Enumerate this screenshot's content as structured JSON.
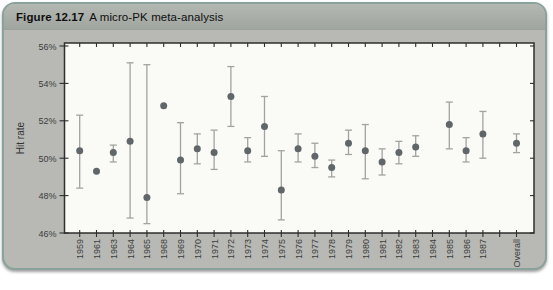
{
  "header": {
    "figure_label": "Figure 12.17",
    "title": "A micro-PK meta-analysis"
  },
  "chart_data": {
    "type": "scatter",
    "title": "Figure 12.17 A micro-PK meta-analysis",
    "ylabel": "Hit rate",
    "xlabel": "",
    "ylim": [
      46,
      56
    ],
    "grid": "off",
    "legend": "none",
    "yticks": [
      {
        "value": 46,
        "label": "46%"
      },
      {
        "value": 48,
        "label": "48%"
      },
      {
        "value": 50,
        "label": "50%"
      },
      {
        "value": 52,
        "label": "52%"
      },
      {
        "value": 54,
        "label": "54%"
      },
      {
        "value": 56,
        "label": "56%"
      }
    ],
    "categories": [
      "1959",
      "1961",
      "1963",
      "1964",
      "1965",
      "1968",
      "1969",
      "1970",
      "1971",
      "1972",
      "1973",
      "1974",
      "1975",
      "1976",
      "1977",
      "1978",
      "1979",
      "1980",
      "1981",
      "1982",
      "1983",
      "1984",
      "1985",
      "1986",
      "1987",
      "",
      "Overall"
    ],
    "points": [
      {
        "x": "1959",
        "y": 50.4,
        "lo": 48.4,
        "hi": 52.3
      },
      {
        "x": "1961",
        "y": 49.3
      },
      {
        "x": "1963",
        "y": 50.3,
        "lo": 49.8,
        "hi": 50.7
      },
      {
        "x": "1964",
        "y": 50.9,
        "lo": 46.8,
        "hi": 55.1
      },
      {
        "x": "1965",
        "y": 47.9,
        "lo": 46.5,
        "hi": 55.0
      },
      {
        "x": "1968",
        "y": 52.8
      },
      {
        "x": "1969",
        "y": 49.9,
        "lo": 48.1,
        "hi": 51.9
      },
      {
        "x": "1970",
        "y": 50.5,
        "lo": 49.7,
        "hi": 51.3
      },
      {
        "x": "1971",
        "y": 50.3,
        "lo": 49.4,
        "hi": 51.5
      },
      {
        "x": "1972",
        "y": 53.3,
        "lo": 51.7,
        "hi": 54.9
      },
      {
        "x": "1973",
        "y": 50.4,
        "lo": 49.8,
        "hi": 51.1
      },
      {
        "x": "1974",
        "y": 51.7,
        "lo": 50.1,
        "hi": 53.3
      },
      {
        "x": "1975",
        "y": 48.3,
        "lo": 46.7,
        "hi": 50.4
      },
      {
        "x": "1976",
        "y": 50.5,
        "lo": 49.8,
        "hi": 51.3
      },
      {
        "x": "1977",
        "y": 50.1,
        "lo": 49.5,
        "hi": 50.8
      },
      {
        "x": "1978",
        "y": 49.5,
        "lo": 49.0,
        "hi": 49.9
      },
      {
        "x": "1979",
        "y": 50.8,
        "lo": 50.2,
        "hi": 51.5
      },
      {
        "x": "1980",
        "y": 50.4,
        "lo": 48.9,
        "hi": 51.8
      },
      {
        "x": "1981",
        "y": 49.8,
        "lo": 49.1,
        "hi": 50.5
      },
      {
        "x": "1982",
        "y": 50.3,
        "lo": 49.7,
        "hi": 50.9
      },
      {
        "x": "1983",
        "y": 50.6,
        "lo": 50.1,
        "hi": 51.2
      },
      {
        "x": "1985",
        "y": 51.8,
        "lo": 50.5,
        "hi": 53.0
      },
      {
        "x": "1986",
        "y": 50.4,
        "lo": 49.8,
        "hi": 51.1
      },
      {
        "x": "1987",
        "y": 51.3,
        "lo": 50.0,
        "hi": 52.5
      },
      {
        "x": "Overall",
        "y": 50.8,
        "lo": 50.3,
        "hi": 51.3
      }
    ]
  },
  "colors": {
    "marker": "#616669",
    "error_bar": "#a2a3a0",
    "axis": "#2e2e2e",
    "plot_bg": "#fafaf7",
    "panel_bg": "#b8b9b5",
    "card_border": "#8aa29b"
  }
}
